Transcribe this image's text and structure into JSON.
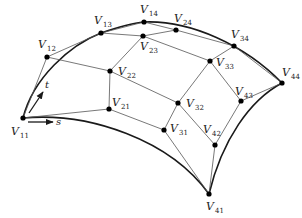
{
  "figure": {
    "colors": {
      "curve": "#1a1a1a",
      "net": "#555555",
      "point": "#000000",
      "text": "#222222"
    },
    "points": [
      {
        "id": "V11",
        "main": "V",
        "sub": "11",
        "x": 23,
        "y": 118,
        "lx": 11,
        "ly": 135
      },
      {
        "id": "V12",
        "main": "V",
        "sub": "12",
        "x": 47,
        "y": 57,
        "lx": 38,
        "ly": 48
      },
      {
        "id": "V13",
        "main": "V",
        "sub": "13",
        "x": 101,
        "y": 33,
        "lx": 94,
        "ly": 24
      },
      {
        "id": "V14",
        "main": "V",
        "sub": "14",
        "x": 144,
        "y": 22,
        "lx": 140,
        "ly": 13
      },
      {
        "id": "V21",
        "main": "V",
        "sub": "21",
        "x": 109,
        "y": 109,
        "lx": 112,
        "ly": 106
      },
      {
        "id": "V22",
        "main": "V",
        "sub": "22",
        "x": 110,
        "y": 71,
        "lx": 118,
        "ly": 75
      },
      {
        "id": "V23",
        "main": "V",
        "sub": "23",
        "x": 143,
        "y": 36,
        "lx": 140,
        "ly": 50
      },
      {
        "id": "V24",
        "main": "V",
        "sub": "24",
        "x": 176,
        "y": 30,
        "lx": 174,
        "ly": 22
      },
      {
        "id": "V31",
        "main": "V",
        "sub": "31",
        "x": 164,
        "y": 130,
        "lx": 170,
        "ly": 132
      },
      {
        "id": "V32",
        "main": "V",
        "sub": "32",
        "x": 178,
        "y": 103,
        "lx": 186,
        "ly": 107
      },
      {
        "id": "V33",
        "main": "V",
        "sub": "33",
        "x": 210,
        "y": 61,
        "lx": 216,
        "ly": 66
      },
      {
        "id": "V34",
        "main": "V",
        "sub": "34",
        "x": 234,
        "y": 46,
        "lx": 231,
        "ly": 38
      },
      {
        "id": "V41",
        "main": "V",
        "sub": "41",
        "x": 209,
        "y": 194,
        "lx": 206,
        "ly": 210
      },
      {
        "id": "V42",
        "main": "V",
        "sub": "42",
        "x": 215,
        "y": 145,
        "lx": 203,
        "ly": 133
      },
      {
        "id": "V43",
        "main": "V",
        "sub": "43",
        "x": 241,
        "y": 101,
        "lx": 235,
        "ly": 95
      },
      {
        "id": "V44",
        "main": "V",
        "sub": "44",
        "x": 282,
        "y": 83,
        "lx": 282,
        "ly": 76
      }
    ],
    "net_lines": [
      [
        "V11",
        "V12",
        "V13",
        "V14"
      ],
      [
        "V21",
        "V22",
        "V23",
        "V24"
      ],
      [
        "V31",
        "V32",
        "V33",
        "V34"
      ],
      [
        "V41",
        "V42",
        "V43",
        "V44"
      ],
      [
        "V11",
        "V21",
        "V31",
        "V41"
      ],
      [
        "V12",
        "V22",
        "V32",
        "V42"
      ],
      [
        "V13",
        "V23",
        "V33",
        "V43"
      ],
      [
        "V14",
        "V24",
        "V34",
        "V44"
      ]
    ],
    "boundary_curves": [
      "M23,118 C33,78 70,45 101,33 C118,27 132,23 144,22",
      "M144,22 C190,20 245,45 282,83",
      "M23,118 C90,112 170,140 209,194",
      "M209,194 C222,140 250,100 282,83"
    ],
    "param_s": {
      "label": "s",
      "x1": 28,
      "y1": 122,
      "x2": 53,
      "y2": 122,
      "lx": 56,
      "ly": 125
    },
    "param_t": {
      "label": "t",
      "x1": 29,
      "y1": 113,
      "x2": 43,
      "y2": 92,
      "lx": 45,
      "ly": 88
    }
  }
}
